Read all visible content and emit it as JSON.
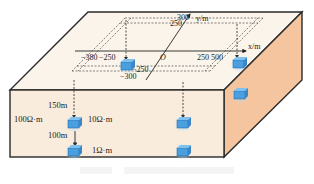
{
  "diagram": {
    "colors": {
      "top_face": "#fbf4ea",
      "front_face": "#f9ecdc",
      "side_face": "#f4c59e",
      "edge": "#2a2a2a",
      "block": "#4a9fe0",
      "block_glow": "#9fd0f2"
    },
    "axes": {
      "x_label": "x/m",
      "y_label": "y/m",
      "origin": "O",
      "x_ticks": [
        "−380",
        "−250",
        "250",
        "500"
      ],
      "y_ticks_top": [
        "300",
        "250"
      ],
      "y_ticks_bottom": [
        "−250",
        "−300"
      ]
    },
    "annotations": {
      "depth_1": "150m",
      "depth_2": "100m",
      "host_resistivity": "100Ω·m",
      "block_1_resistivity": "10Ω·m",
      "block_2_resistivity": "1Ω·m"
    },
    "caption": "       "
  }
}
